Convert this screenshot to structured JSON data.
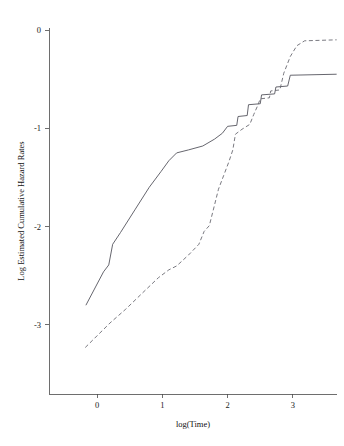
{
  "chart_data": {
    "type": "line",
    "title": "",
    "xlabel": "log(Time)",
    "ylabel": "Log Estimated Cumulative Hazard Rates",
    "xlim": [
      -0.75,
      4.41
    ],
    "ylim": [
      -3.72,
      0.29
    ],
    "xticks": [
      0,
      1,
      2,
      3
    ],
    "xticklabels": [
      "0",
      "1",
      "2",
      "3"
    ],
    "yticks": [
      0,
      -1,
      -2,
      -3
    ],
    "yticklabels": [
      "0",
      "-1",
      "-2",
      "-3"
    ],
    "grid": false,
    "legend": null,
    "legend_position": "none",
    "series": [
      {
        "name": "solid-curve",
        "style": "solid",
        "color": "#55555e",
        "points": [
          [
            -0.17,
            -2.8
          ],
          [
            0.1,
            -2.46
          ],
          [
            0.18,
            -2.39
          ],
          [
            0.24,
            -2.18
          ],
          [
            0.36,
            -2.06
          ],
          [
            0.58,
            -1.83
          ],
          [
            0.8,
            -1.6
          ],
          [
            0.98,
            -1.44
          ],
          [
            1.1,
            -1.33
          ],
          [
            1.22,
            -1.25
          ],
          [
            1.4,
            -1.22
          ],
          [
            1.62,
            -1.18
          ],
          [
            1.8,
            -1.11
          ],
          [
            1.92,
            -1.05
          ],
          [
            2.0,
            -0.98
          ],
          [
            2.14,
            -0.97
          ],
          [
            2.16,
            -0.88
          ],
          [
            2.3,
            -0.87
          ],
          [
            2.32,
            -0.76
          ],
          [
            2.5,
            -0.75
          ],
          [
            2.52,
            -0.66
          ],
          [
            2.72,
            -0.65
          ],
          [
            2.74,
            -0.58
          ],
          [
            2.92,
            -0.57
          ],
          [
            2.96,
            -0.46
          ],
          [
            3.67,
            -0.45
          ]
        ]
      },
      {
        "name": "dashed-curve",
        "style": "dashed",
        "color": "#6a6a72",
        "points": [
          [
            -0.18,
            -3.23
          ],
          [
            0.2,
            -2.98
          ],
          [
            0.44,
            -2.84
          ],
          [
            0.72,
            -2.66
          ],
          [
            0.94,
            -2.52
          ],
          [
            1.1,
            -2.44
          ],
          [
            1.22,
            -2.4
          ],
          [
            1.4,
            -2.29
          ],
          [
            1.56,
            -2.18
          ],
          [
            1.64,
            -2.05
          ],
          [
            1.72,
            -1.99
          ],
          [
            1.8,
            -1.78
          ],
          [
            1.86,
            -1.62
          ],
          [
            1.94,
            -1.48
          ],
          [
            2.02,
            -1.34
          ],
          [
            2.08,
            -1.22
          ],
          [
            2.12,
            -1.06
          ],
          [
            2.22,
            -1.01
          ],
          [
            2.34,
            -0.96
          ],
          [
            2.4,
            -0.86
          ],
          [
            2.46,
            -0.77
          ],
          [
            2.5,
            -0.7
          ],
          [
            2.64,
            -0.69
          ],
          [
            2.66,
            -0.62
          ],
          [
            2.8,
            -0.61
          ],
          [
            2.86,
            -0.44
          ],
          [
            2.96,
            -0.27
          ],
          [
            3.06,
            -0.16
          ],
          [
            3.18,
            -0.11
          ],
          [
            3.67,
            -0.1
          ]
        ]
      }
    ]
  },
  "axes": {
    "x_axis_label": "log(Time)",
    "y_axis_label": "Log Estimated Cumulative Hazard Rates"
  }
}
